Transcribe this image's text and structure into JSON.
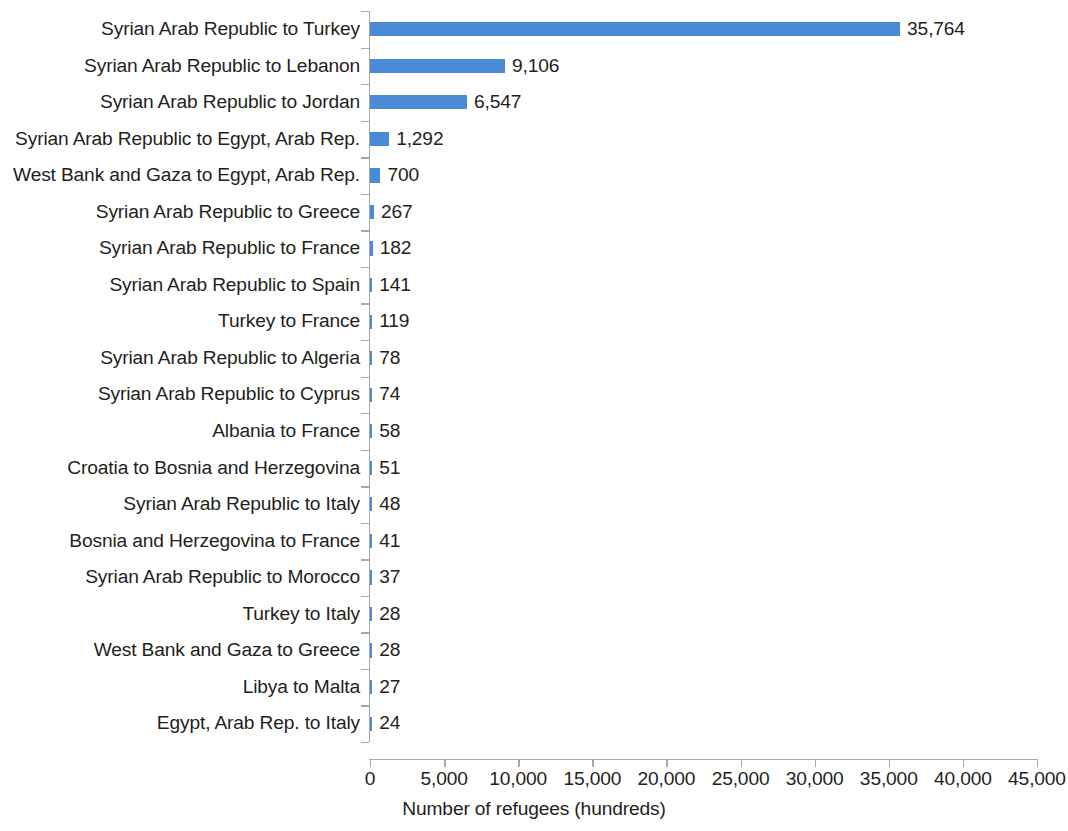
{
  "chart_data": {
    "type": "bar",
    "orientation": "horizontal",
    "title": "",
    "subtitle": "",
    "xlabel": "Number of refugees (hundreds)",
    "ylabel": "",
    "xlim": [
      0,
      45000
    ],
    "x_ticks": [
      0,
      5000,
      10000,
      15000,
      20000,
      25000,
      30000,
      35000,
      40000,
      45000
    ],
    "x_tick_labels": [
      "0",
      "5,000",
      "10,000",
      "15,000",
      "20,000",
      "25,000",
      "30,000",
      "35,000",
      "40,000",
      "45,000"
    ],
    "grid": false,
    "legend": null,
    "legend_position": "none",
    "bar_color": "#4a8ad6",
    "axis_color": "#a7a9ac",
    "text_color": "#231f20",
    "data_labels_shown": true,
    "categories": [
      "Syrian Arab Republic to Turkey",
      "Syrian Arab Republic to Lebanon",
      "Syrian Arab Republic to Jordan",
      "Syrian Arab Republic to Egypt, Arab Rep.",
      "West Bank and Gaza to Egypt, Arab Rep.",
      "Syrian Arab Republic to Greece",
      "Syrian Arab Republic to France",
      "Syrian Arab Republic to Spain",
      "Turkey to France",
      "Syrian Arab Republic to Algeria",
      "Syrian Arab Republic to Cyprus",
      "Albania to France",
      "Croatia to Bosnia and Herzegovina",
      "Syrian Arab Republic to Italy",
      "Bosnia and Herzegovina to France",
      "Syrian Arab Republic to Morocco",
      "Turkey to Italy",
      "West Bank and Gaza to Greece",
      "Libya to Malta",
      "Egypt, Arab Rep. to Italy"
    ],
    "values": [
      35764,
      9106,
      6547,
      1292,
      700,
      267,
      182,
      141,
      119,
      78,
      74,
      58,
      51,
      48,
      41,
      37,
      28,
      28,
      27,
      24
    ],
    "value_labels": [
      "35,764",
      "9,106",
      "6,547",
      "1,292",
      "700",
      "267",
      "182",
      "141",
      "119",
      "78",
      "74",
      "58",
      "51",
      "48",
      "41",
      "37",
      "28",
      "28",
      "27",
      "24"
    ]
  }
}
